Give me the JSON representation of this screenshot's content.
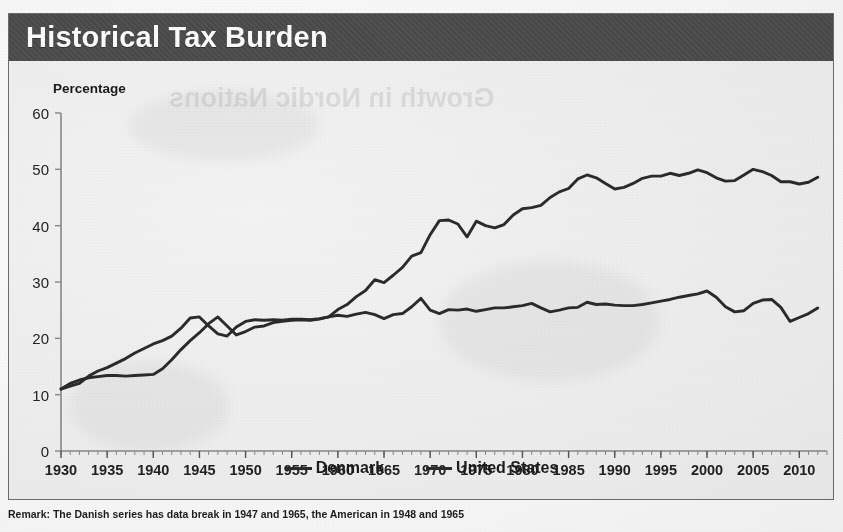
{
  "header": {
    "title": "Historical Tax Burden"
  },
  "watermark": {
    "text": "Growth in Nordic Nations"
  },
  "footnote": {
    "text": "Remark: The Danish series has data break in 1947 and 1965, the American in 1948 and 1965"
  },
  "legend": {
    "position": "bottom-center",
    "items": [
      {
        "label": "Denmark",
        "color": "#2b2b2b"
      },
      {
        "label": "United States",
        "color": "#2b2b2b"
      }
    ]
  },
  "colors": {
    "header_background": "#4a4a4a",
    "header_text": "#ffffff",
    "plot_background": "#f3f3f3",
    "line": "#2b2b2b",
    "axis": "#8a8a8a",
    "frame": "#6f6f6f"
  },
  "chart_data": {
    "type": "line",
    "title": "Historical Tax Burden",
    "subtitle": "",
    "xlabel": "",
    "ylabel": "Percentage",
    "ylim": [
      0,
      60
    ],
    "xlim": [
      1930,
      2013
    ],
    "grid": false,
    "ytick_labels": [
      "0",
      "10",
      "20",
      "30",
      "40",
      "50",
      "60"
    ],
    "ytick_values": [
      0,
      10,
      20,
      30,
      40,
      50,
      60
    ],
    "xtick_labels": [
      "1930",
      "1935",
      "1940",
      "1945",
      "1950",
      "1955",
      "1960",
      "1965",
      "1970",
      "1975",
      "1980",
      "1985",
      "1990",
      "1995",
      "2000",
      "2005",
      "2010"
    ],
    "xtick_values": [
      1930,
      1935,
      1940,
      1945,
      1950,
      1955,
      1960,
      1965,
      1970,
      1975,
      1980,
      1985,
      1990,
      1995,
      2000,
      2005,
      2010
    ],
    "minor_xticks": "annual",
    "annotations": [
      "Remark: The Danish series has data break in 1947 and 1965, the American in 1948 and 1965"
    ],
    "x": [
      1930,
      1931,
      1932,
      1933,
      1934,
      1935,
      1936,
      1937,
      1938,
      1939,
      1940,
      1941,
      1942,
      1943,
      1944,
      1945,
      1946,
      1947,
      1948,
      1949,
      1950,
      1951,
      1952,
      1953,
      1954,
      1955,
      1956,
      1957,
      1958,
      1959,
      1960,
      1961,
      1962,
      1963,
      1964,
      1965,
      1966,
      1967,
      1968,
      1969,
      1970,
      1971,
      1972,
      1973,
      1974,
      1975,
      1976,
      1977,
      1978,
      1979,
      1980,
      1981,
      1982,
      1983,
      1984,
      1985,
      1986,
      1987,
      1988,
      1989,
      1990,
      1991,
      1992,
      1993,
      1994,
      1995,
      1996,
      1997,
      1998,
      1999,
      2000,
      2001,
      2002,
      2003,
      2004,
      2005,
      2006,
      2007,
      2008,
      2009,
      2010,
      2011,
      2012
    ],
    "series": [
      {
        "name": "Denmark",
        "color": "#2b2b2b",
        "values": [
          11.0,
          12.0,
          12.6,
          13.0,
          13.2,
          13.4,
          13.4,
          13.3,
          13.4,
          13.5,
          13.6,
          14.6,
          16.2,
          18.0,
          19.6,
          21.0,
          22.6,
          23.8,
          22.2,
          20.6,
          21.2,
          22.0,
          22.2,
          22.8,
          23.0,
          23.2,
          23.3,
          23.2,
          23.4,
          23.8,
          25.1,
          26.0,
          27.4,
          28.5,
          30.4,
          29.9,
          31.2,
          32.6,
          34.6,
          35.2,
          38.4,
          40.9,
          41.0,
          40.3,
          38.0,
          40.8,
          40.0,
          39.6,
          40.2,
          41.9,
          43.0,
          43.2,
          43.6,
          45.0,
          46.0,
          46.6,
          48.3,
          49.0,
          48.5,
          47.5,
          46.5,
          46.8,
          47.5,
          48.4,
          48.8,
          48.8,
          49.3,
          48.9,
          49.3,
          49.9,
          49.4,
          48.5,
          47.9,
          48.0,
          49.0,
          50.0,
          49.6,
          48.9,
          47.8,
          47.8,
          47.4,
          47.7,
          48.6
        ]
      },
      {
        "name": "United States",
        "color": "#2b2b2b",
        "values": [
          11.0,
          11.5,
          12.0,
          13.3,
          14.2,
          14.8,
          15.6,
          16.4,
          17.4,
          18.2,
          19.0,
          19.6,
          20.4,
          21.8,
          23.6,
          23.8,
          22.2,
          20.8,
          20.4,
          22.0,
          23.0,
          23.3,
          23.2,
          23.3,
          23.2,
          23.4,
          23.4,
          23.3,
          23.5,
          23.8,
          24.1,
          23.9,
          24.3,
          24.6,
          24.2,
          23.5,
          24.2,
          24.4,
          25.6,
          27.1,
          25.0,
          24.4,
          25.1,
          25.0,
          25.2,
          24.8,
          25.1,
          25.4,
          25.4,
          25.6,
          25.8,
          26.2,
          25.4,
          24.7,
          25.0,
          25.4,
          25.5,
          26.4,
          26.0,
          26.1,
          25.9,
          25.8,
          25.8,
          26.0,
          26.3,
          26.6,
          26.9,
          27.3,
          27.6,
          27.9,
          28.4,
          27.3,
          25.6,
          24.7,
          24.9,
          26.2,
          26.8,
          26.9,
          25.5,
          23.0,
          23.7,
          24.4,
          25.4
        ]
      }
    ]
  }
}
